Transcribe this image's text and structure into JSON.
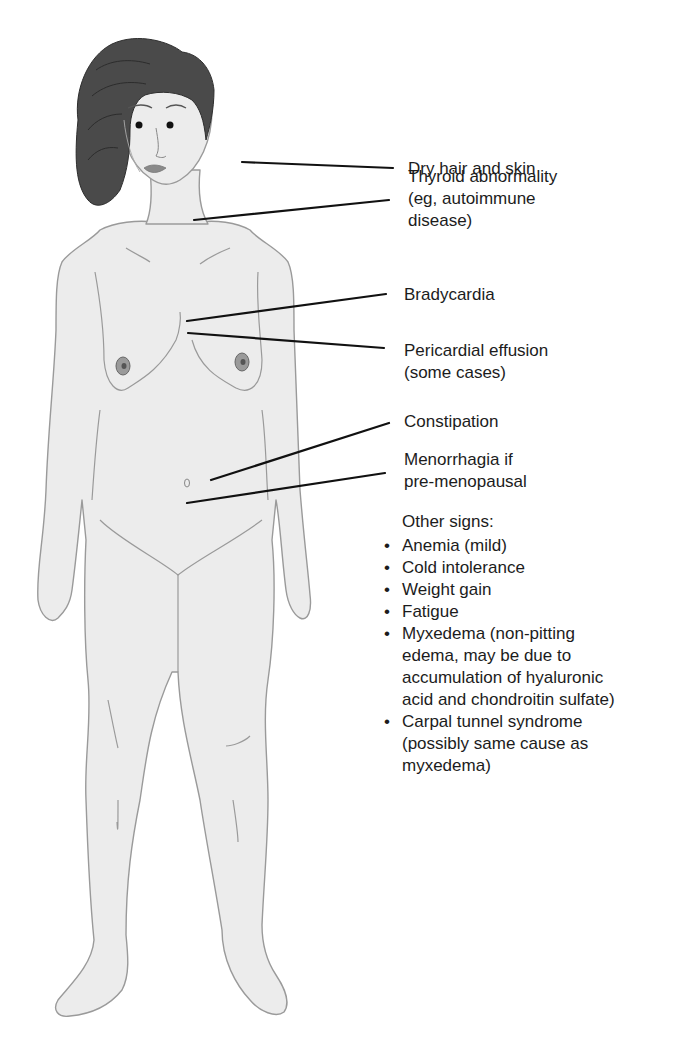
{
  "diagram": {
    "colors": {
      "skin": "#ececec",
      "outline": "#9a9a9a",
      "hair": "#4a4a4a",
      "leader_line": "#111111",
      "text": "#1c1c1c"
    },
    "labels": [
      {
        "id": "dry-hair-skin",
        "lines": [
          "Dry hair and skin"
        ]
      },
      {
        "id": "thyroid-abnormality",
        "lines": [
          "Thyroid abnormality",
          "(eg, autoimmune",
          "disease)"
        ]
      },
      {
        "id": "bradycardia",
        "lines": [
          "Bradycardia"
        ]
      },
      {
        "id": "pericardial-effusion",
        "lines": [
          "Pericardial effusion",
          "(some cases)"
        ]
      },
      {
        "id": "constipation",
        "lines": [
          "Constipation"
        ]
      },
      {
        "id": "menorrhagia",
        "lines": [
          "Menorrhagia if",
          "pre-menopausal"
        ]
      }
    ],
    "other_signs": {
      "heading": "Other signs:",
      "bullet": "•",
      "items": [
        {
          "lines": [
            "Anemia (mild)"
          ]
        },
        {
          "lines": [
            "Cold intolerance"
          ]
        },
        {
          "lines": [
            "Weight gain"
          ]
        },
        {
          "lines": [
            "Fatigue"
          ]
        },
        {
          "lines": [
            "Myxedema (non-pitting",
            "edema, may be due to",
            "accumulation of hyaluronic",
            "acid and chondroitin sulfate)"
          ]
        },
        {
          "lines": [
            "Carpal tunnel syndrome",
            "(possibly same cause as",
            "myxedema)"
          ]
        }
      ]
    }
  }
}
